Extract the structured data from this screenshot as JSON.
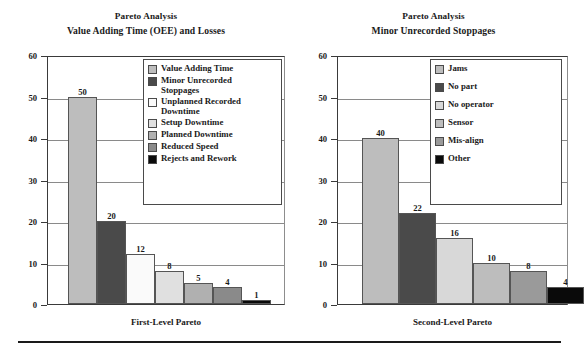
{
  "figure": {
    "background": "#ffffff",
    "bottom_rule_color": "#1a1a1a"
  },
  "chart_data": [
    {
      "id": "first-level-pareto",
      "type": "bar",
      "title": "Pareto Analysis",
      "subtitle": "Value Adding Time (OEE) and Losses",
      "xlabel": "First-Level Pareto",
      "ylabel": "",
      "ylim": [
        0,
        60
      ],
      "yticks": [
        0,
        10,
        20,
        30,
        40,
        50,
        60
      ],
      "grid": true,
      "legend_position": "top-right",
      "categories": [
        "Value Adding Time",
        "Minor Unrecorded Stoppages",
        "Unplanned Recorded Downtime",
        "Setup Downtime",
        "Planned Downtime",
        "Reduced Speed",
        "Rejects and Rework"
      ],
      "values": [
        50,
        20,
        12,
        8,
        5,
        4,
        1
      ],
      "colors": [
        "#bdbdbd",
        "#4a4a4a",
        "#fafafa",
        "#e0e0e0",
        "#b0b0b0",
        "#8a8a8a",
        "#0a0a0a"
      ],
      "legend": [
        {
          "label": "Value Adding Time",
          "color": "#bdbdbd"
        },
        {
          "label": "Minor Unrecorded\nStoppages",
          "color": "#4a4a4a"
        },
        {
          "label": "Unplanned Recorded\nDowntime",
          "color": "#fafafa"
        },
        {
          "label": "Setup Downtime",
          "color": "#e0e0e0"
        },
        {
          "label": "Planned Downtime",
          "color": "#b0b0b0"
        },
        {
          "label": "Reduced Speed",
          "color": "#8a8a8a"
        },
        {
          "label": "Rejects and Rework",
          "color": "#0a0a0a"
        }
      ]
    },
    {
      "id": "second-level-pareto",
      "type": "bar",
      "title": "Pareto Analysis",
      "subtitle": "Minor Unrecorded Stoppages",
      "xlabel": "Second-Level Pareto",
      "ylabel": "",
      "ylim": [
        0,
        60
      ],
      "yticks": [
        0,
        10,
        20,
        30,
        40,
        50,
        60
      ],
      "grid": true,
      "legend_position": "top-right",
      "categories": [
        "Jams",
        "No part",
        "No operator",
        "Sensor",
        "Mis-align",
        "Other"
      ],
      "values": [
        40,
        22,
        16,
        10,
        8,
        4
      ],
      "colors": [
        "#bdbdbd",
        "#4a4a4a",
        "#d8d8d8",
        "#bdbdbd",
        "#9a9a9a",
        "#0a0a0a"
      ],
      "legend": [
        {
          "label": "Jams",
          "color": "#bdbdbd"
        },
        {
          "label": "No part",
          "color": "#4a4a4a"
        },
        {
          "label": "No operator",
          "color": "#d8d8d8"
        },
        {
          "label": "Sensor",
          "color": "#bdbdbd"
        },
        {
          "label": "Mis-align",
          "color": "#9a9a9a"
        },
        {
          "label": "Other",
          "color": "#0a0a0a"
        }
      ]
    }
  ]
}
